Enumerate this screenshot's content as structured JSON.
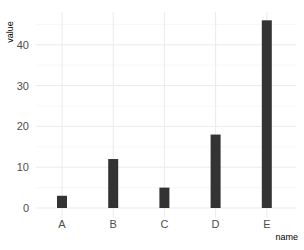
{
  "chart_data": {
    "type": "bar",
    "title": "",
    "xlabel": "name",
    "ylabel": "value",
    "categories": [
      "A",
      "B",
      "C",
      "D",
      "E"
    ],
    "values": [
      3,
      12,
      5,
      18,
      46
    ],
    "ylim": [
      0,
      48
    ],
    "yticks": [
      0,
      10,
      20,
      30,
      40
    ],
    "grid": true,
    "legend": "none",
    "bar_color": "#333333",
    "theme": "minimal"
  }
}
